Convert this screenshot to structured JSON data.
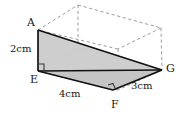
{
  "figure": {
    "type": "geometry-diagram",
    "background_color": "#ffffff",
    "solid_line_color": "#111111",
    "dashed_line_color": "#9a9a9a",
    "shade_fill_color": "#c9c9c9",
    "shade_fill_color_dark": "#bdbdbd",
    "vertices": [
      {
        "id": "A",
        "label": "A",
        "x": 38,
        "y": 30
      },
      {
        "id": "E",
        "label": "E",
        "x": 38,
        "y": 71
      },
      {
        "id": "F",
        "label": "F",
        "x": 113,
        "y": 90
      },
      {
        "id": "G",
        "label": "G",
        "x": 162,
        "y": 70
      }
    ],
    "measurements": [
      {
        "id": "height-AE",
        "label": "2cm",
        "edge": "A-E"
      },
      {
        "id": "length-EF",
        "label": "4cm",
        "edge": "E-F"
      },
      {
        "id": "length-FG",
        "label": "3cm",
        "edge": "F-G"
      }
    ],
    "right_angle_marks": [
      {
        "id": "right-angle-E",
        "at": "E"
      },
      {
        "id": "right-angle-F",
        "at": "F"
      }
    ]
  }
}
